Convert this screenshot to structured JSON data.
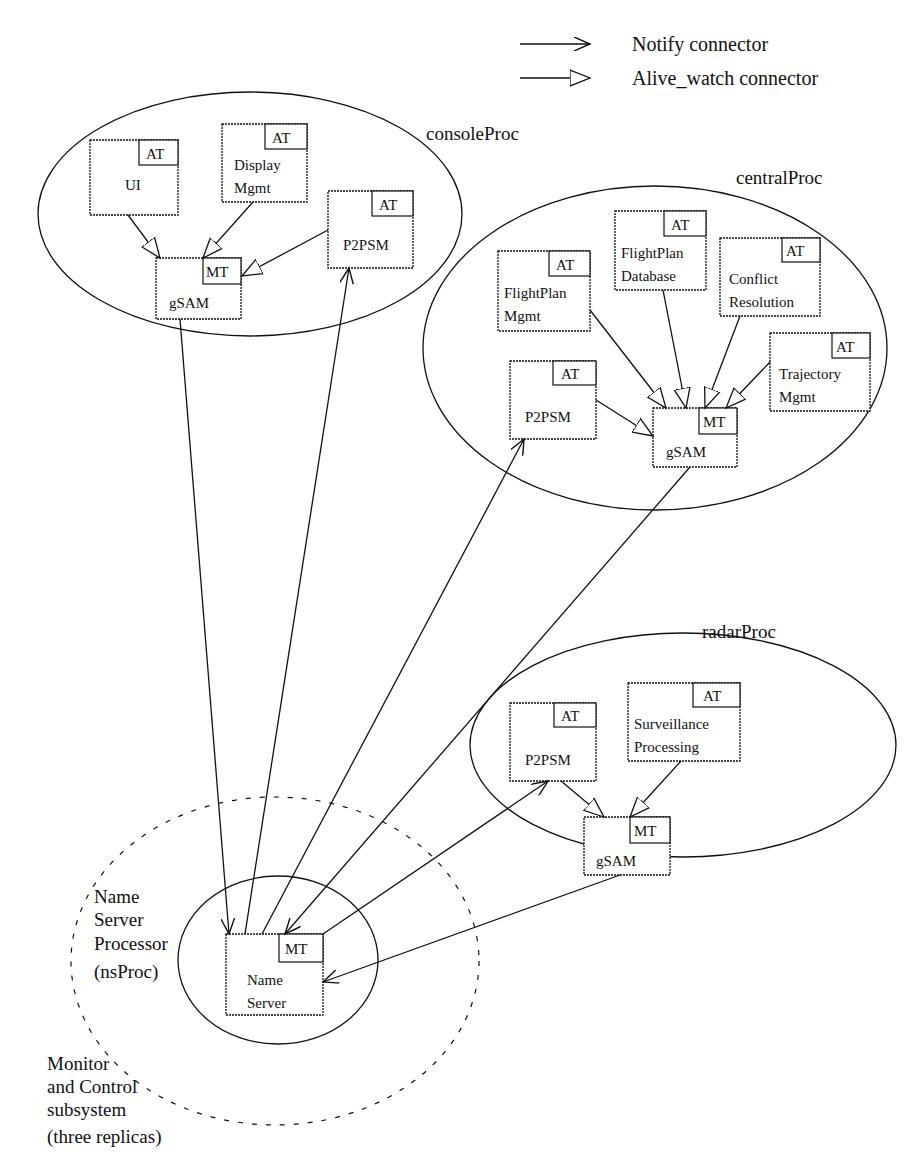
{
  "legend": {
    "notify": "Notify  connector",
    "alive_watch": "Alive_watch  connector"
  },
  "processes": {
    "console": {
      "label": "consoleProc",
      "ui": {
        "line1": "UI",
        "tag": "AT"
      },
      "display": {
        "line1": "Display",
        "line2": "Mgmt",
        "tag": "AT"
      },
      "p2psm": {
        "line1": "P2PSM",
        "tag": "AT"
      },
      "gsam": {
        "line1": "gSAM",
        "tag": "MT"
      }
    },
    "central": {
      "label": "centralProc",
      "fp_mgmt": {
        "line1": "FlightPlan",
        "line2": "Mgmt",
        "tag": "AT"
      },
      "fp_db": {
        "line1": "FlightPlan",
        "line2": "Database",
        "tag": "AT"
      },
      "conflict": {
        "line1": "Conflict",
        "line2": "Resolution",
        "tag": "AT"
      },
      "trajectory": {
        "line1": "Trajectory",
        "line2": "Mgmt",
        "tag": "AT"
      },
      "p2psm": {
        "line1": "P2PSM",
        "tag": "AT"
      },
      "gsam": {
        "line1": "gSAM",
        "tag": "MT"
      }
    },
    "radar": {
      "label": "radarProc",
      "p2psm": {
        "line1": "P2PSM",
        "tag": "AT"
      },
      "surveillance": {
        "line1": "Surveillance",
        "line2": "Processing",
        "tag": "AT"
      },
      "gsam": {
        "line1": "gSAM",
        "tag": "MT"
      }
    },
    "ns": {
      "label_lines": [
        "Name",
        "Server",
        "Processor",
        "(nsProc)"
      ],
      "name_server": {
        "line1": "Name",
        "line2": "Server",
        "tag": "MT"
      }
    }
  },
  "subsystem": {
    "label_lines": [
      "Monitor",
      "and Control",
      "subsystem",
      "(three replicas)"
    ]
  },
  "colors": {
    "ink": "#111111",
    "background": "#ffffff"
  }
}
